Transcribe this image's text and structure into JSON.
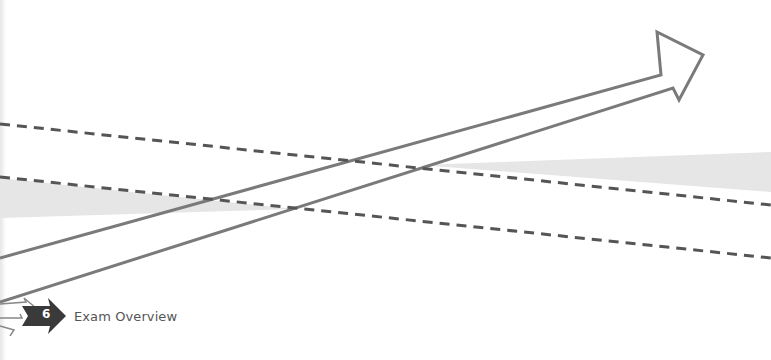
{
  "chapter": {
    "number": "6",
    "title": "Exam Overview"
  },
  "colors": {
    "line": "#7a7a7a",
    "dash": "#555555",
    "band": "#e6e6e6",
    "icon_dark": "#3a3a3a",
    "text": "#555555"
  },
  "graphics": {
    "main_arrow": "outlined arrow pointing up-right",
    "dashed_lines": 2,
    "gray_band": "shaded diagonal band"
  }
}
